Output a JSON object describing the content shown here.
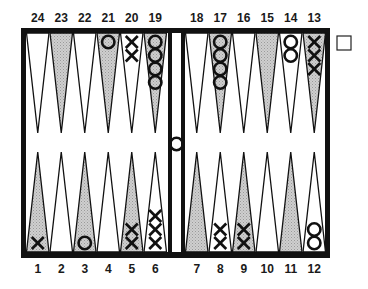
{
  "board": {
    "title": "Backgammon position diagram",
    "colors": {
      "frame": "#111111",
      "light_point": "#ffffff",
      "dark_point": "#c8c8c8",
      "background": "#ffffff"
    },
    "top_labels": [
      "24",
      "23",
      "22",
      "21",
      "20",
      "19",
      "18",
      "17",
      "16",
      "15",
      "14",
      "13"
    ],
    "bottom_labels": [
      "1",
      "2",
      "3",
      "4",
      "5",
      "6",
      "7",
      "8",
      "9",
      "10",
      "11",
      "12"
    ],
    "points": [
      {
        "n": 1,
        "shade": "dark",
        "checkers": {
          "player": "X",
          "count": 1
        }
      },
      {
        "n": 2,
        "shade": "light",
        "checkers": null
      },
      {
        "n": 3,
        "shade": "dark",
        "checkers": {
          "player": "O",
          "count": 1
        }
      },
      {
        "n": 4,
        "shade": "light",
        "checkers": null
      },
      {
        "n": 5,
        "shade": "dark",
        "checkers": {
          "player": "X",
          "count": 2
        }
      },
      {
        "n": 6,
        "shade": "light",
        "checkers": {
          "player": "X",
          "count": 3
        }
      },
      {
        "n": 7,
        "shade": "dark",
        "checkers": null
      },
      {
        "n": 8,
        "shade": "light",
        "checkers": {
          "player": "X",
          "count": 2
        }
      },
      {
        "n": 9,
        "shade": "dark",
        "checkers": {
          "player": "X",
          "count": 2
        }
      },
      {
        "n": 10,
        "shade": "light",
        "checkers": null
      },
      {
        "n": 11,
        "shade": "dark",
        "checkers": null
      },
      {
        "n": 12,
        "shade": "light",
        "checkers": {
          "player": "O",
          "count": 2
        }
      },
      {
        "n": 13,
        "shade": "dark",
        "checkers": {
          "player": "X",
          "count": 3
        }
      },
      {
        "n": 14,
        "shade": "light",
        "checkers": {
          "player": "O",
          "count": 2
        }
      },
      {
        "n": 15,
        "shade": "dark",
        "checkers": null
      },
      {
        "n": 16,
        "shade": "light",
        "checkers": null
      },
      {
        "n": 17,
        "shade": "dark",
        "checkers": {
          "player": "O",
          "count": 4
        }
      },
      {
        "n": 18,
        "shade": "light",
        "checkers": null
      },
      {
        "n": 19,
        "shade": "dark",
        "checkers": {
          "player": "O",
          "count": 4
        }
      },
      {
        "n": 20,
        "shade": "light",
        "checkers": {
          "player": "X",
          "count": 2
        }
      },
      {
        "n": 21,
        "shade": "dark",
        "checkers": {
          "player": "O",
          "count": 1
        }
      },
      {
        "n": 22,
        "shade": "light",
        "checkers": null
      },
      {
        "n": 23,
        "shade": "dark",
        "checkers": null
      },
      {
        "n": 24,
        "shade": "light",
        "checkers": null
      }
    ],
    "bar": {
      "checkers": [
        {
          "player": "O",
          "count": 1
        }
      ]
    },
    "doubling_cube": {
      "value": "",
      "position": "right-top"
    }
  }
}
